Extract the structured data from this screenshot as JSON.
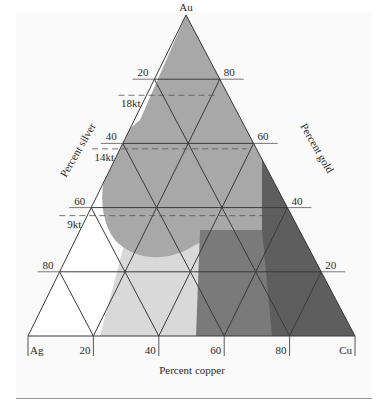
{
  "diagram": {
    "type": "ternary",
    "vertices": {
      "top": "Au",
      "bottom_left": "Ag",
      "bottom_right": "Cu"
    },
    "axis_labels": {
      "silver": "Percent silver",
      "gold": "Percent gold",
      "copper": "Percent copper"
    },
    "silver_ticks": [
      "20",
      "40",
      "60",
      "80"
    ],
    "gold_ticks": [
      "80",
      "60",
      "40",
      "20"
    ],
    "copper_ticks": [
      "20",
      "40",
      "60",
      "80"
    ],
    "karat_lines": [
      {
        "label": "18kt",
        "gold_fraction": 0.75
      },
      {
        "label": "14kt",
        "gold_fraction": 0.583
      },
      {
        "label": "9kt",
        "gold_fraction": 0.375
      }
    ],
    "grid_step_percent": 20,
    "colors": {
      "frame_bg": "#fafafa",
      "white_region": "#ffffff",
      "light_region": "#d9d9d9",
      "mid_light_region": "#bdbdbd",
      "mid_region": "#a8a8a8",
      "dark_region": "#7a7a7a",
      "darkest_region": "#5e5e5e",
      "grid_line": "#3a3a3a"
    }
  }
}
